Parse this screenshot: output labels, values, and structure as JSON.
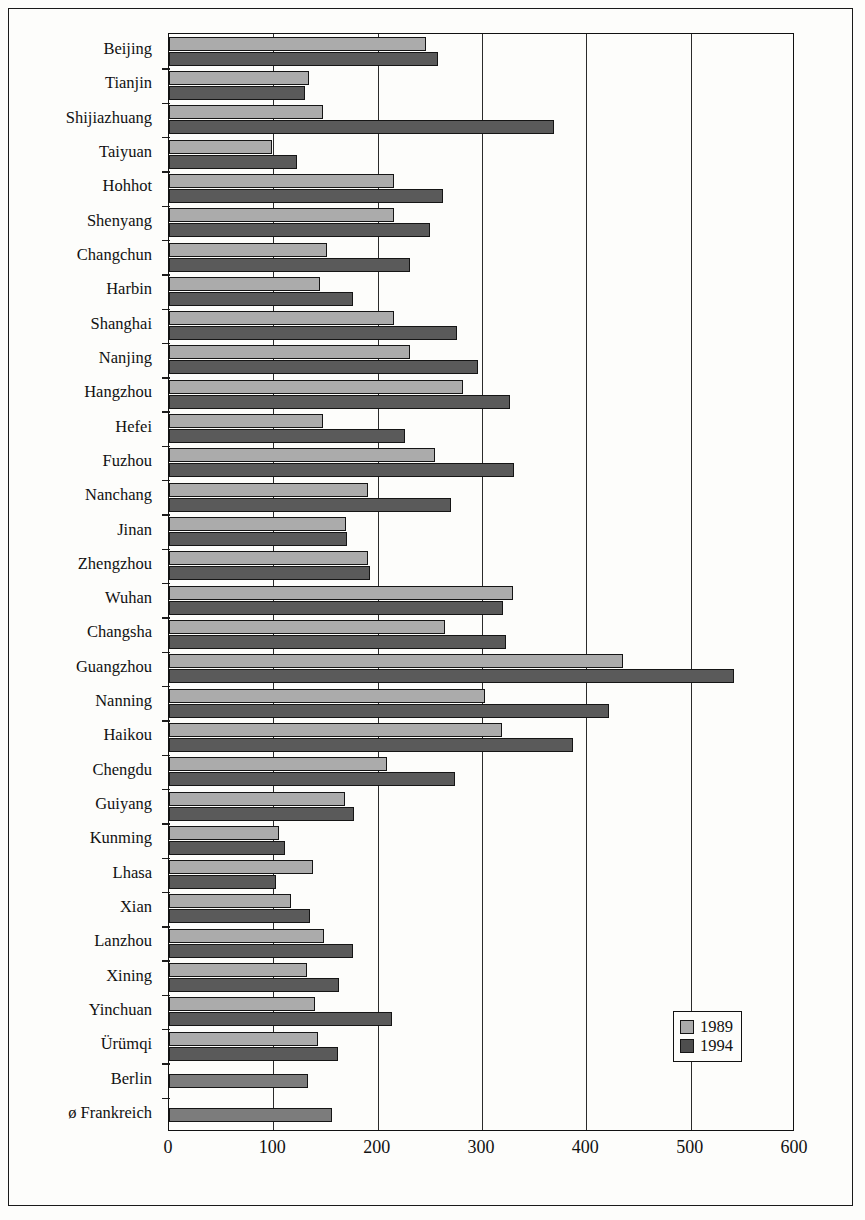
{
  "chart_data": {
    "type": "bar",
    "orientation": "horizontal",
    "title": "",
    "xlabel": "",
    "ylabel": "",
    "xlim": [
      0,
      600
    ],
    "xticks": [
      0,
      100,
      200,
      300,
      400,
      500,
      600
    ],
    "xtick_labels": [
      "0",
      "100",
      "200",
      "300",
      "400",
      "500",
      "600"
    ],
    "grid": "vertical",
    "legend_position": "bottom-right",
    "legend": [
      "1989",
      "1994"
    ],
    "colors": {
      "1989": "#ababab",
      "1994": "#5a5a5a",
      "single": "#7c7c7c",
      "axis": "#111111",
      "background": "#fdfdfb"
    },
    "categories": [
      "Beijing",
      "Tianjin",
      "Shijiazhuang",
      "Taiyuan",
      "Hohhot",
      "Shenyang",
      "Changchun",
      "Harbin",
      "Shanghai",
      "Nanjing",
      "Hangzhou",
      "Hefei",
      "Fuzhou",
      "Nanchang",
      "Jinan",
      "Zhengzhou",
      "Wuhan",
      "Changsha",
      "Guangzhou",
      "Nanning",
      "Haikou",
      "Chengdu",
      "Guiyang",
      "Kunming",
      "Lhasa",
      "Xian",
      "Lanzhou",
      "Xining",
      "Yinchuan",
      "Ürümqi",
      "Berlin",
      "ø Frankreich"
    ],
    "series": [
      {
        "name": "1989",
        "values": [
          246,
          134,
          148,
          99,
          216,
          216,
          151,
          145,
          216,
          231,
          282,
          148,
          255,
          191,
          170,
          191,
          330,
          265,
          435,
          303,
          319,
          209,
          169,
          105,
          138,
          117,
          149,
          132,
          140,
          143,
          null,
          null
        ]
      },
      {
        "name": "1994",
        "values": [
          258,
          130,
          369,
          123,
          263,
          250,
          231,
          176,
          276,
          296,
          327,
          226,
          331,
          270,
          171,
          193,
          320,
          323,
          542,
          422,
          387,
          274,
          177,
          111,
          103,
          135,
          176,
          163,
          214,
          162,
          133,
          156
        ]
      }
    ]
  }
}
